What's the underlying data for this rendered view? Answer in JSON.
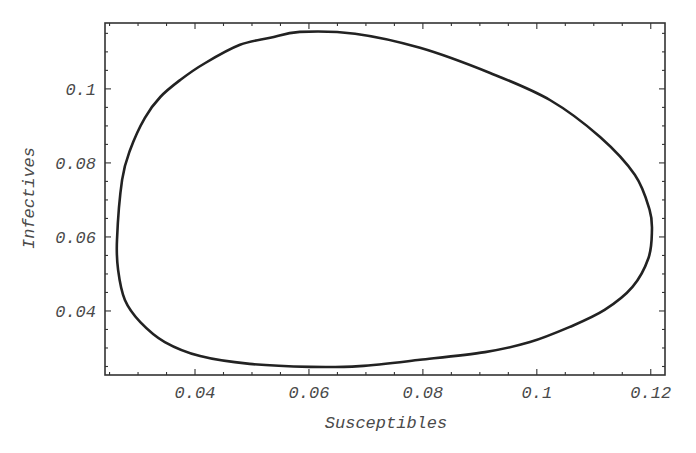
{
  "chart_data": {
    "type": "line",
    "title": "",
    "xlabel": "Susceptibles",
    "ylabel": "Infectives",
    "xlim": [
      0.0242,
      0.1225
    ],
    "ylim": [
      0.0227,
      0.1178
    ],
    "grid": false,
    "legend": null,
    "x_ticks": [
      0.04,
      0.06,
      0.08,
      0.1,
      0.12
    ],
    "x_tick_labels": [
      "0.04",
      "0.06",
      "0.08",
      "0.1",
      "0.12"
    ],
    "y_ticks": [
      0.04,
      0.06,
      0.08,
      0.1
    ],
    "y_tick_labels": [
      "0.04",
      "0.06",
      "0.08",
      "0.1"
    ],
    "minor_tick_step": 0.005,
    "series": [
      {
        "name": "phase trajectory (closed orbit)",
        "closed": true,
        "color": "#222222",
        "x": [
          0.0263,
          0.0272,
          0.0286,
          0.0312,
          0.0339,
          0.0374,
          0.0418,
          0.0479,
          0.0532,
          0.0584,
          0.0681,
          0.0795,
          0.0918,
          0.1023,
          0.1111,
          0.1172,
          0.1198,
          0.1202,
          0.1196,
          0.1168,
          0.1119,
          0.1058,
          0.0988,
          0.0909,
          0.0795,
          0.0689,
          0.0602,
          0.0496,
          0.0409,
          0.0347,
          0.0304,
          0.0277,
          0.0265
        ],
        "y": [
          0.0592,
          0.0754,
          0.0835,
          0.0922,
          0.0978,
          0.1024,
          0.107,
          0.1119,
          0.1138,
          0.1154,
          0.1149,
          0.1111,
          0.1043,
          0.097,
          0.087,
          0.0768,
          0.0673,
          0.0614,
          0.0543,
          0.0465,
          0.0403,
          0.0357,
          0.0316,
          0.0289,
          0.0268,
          0.0251,
          0.0249,
          0.0257,
          0.0278,
          0.0316,
          0.037,
          0.043,
          0.0511
        ]
      }
    ]
  }
}
